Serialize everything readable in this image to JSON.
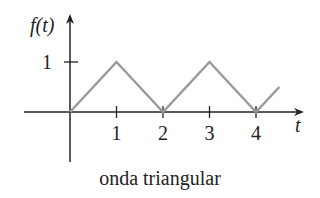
{
  "caption": "onda triangular",
  "colors": {
    "axis": "#222222",
    "wave": "#9a9a9a",
    "text": "#222222"
  },
  "chart_data": {
    "type": "line",
    "title": "onda triangular",
    "xlabel": "t",
    "ylabel": "f(t)",
    "x_ticks": [
      1,
      2,
      3,
      4
    ],
    "x_tick_labels": [
      "1",
      "2",
      "3",
      "4"
    ],
    "y_ticks": [
      1
    ],
    "y_tick_labels": [
      "1"
    ],
    "xlim": [
      -1,
      5
    ],
    "ylim": [
      -1,
      1.9
    ],
    "grid": false,
    "legend": null,
    "series": [
      {
        "name": "f(t)",
        "x": [
          0,
          1,
          2,
          3,
          4,
          4.5
        ],
        "y": [
          0,
          1,
          0,
          1,
          0,
          0.5
        ]
      }
    ]
  }
}
